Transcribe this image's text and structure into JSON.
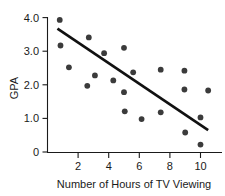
{
  "chart_data": {
    "type": "scatter",
    "title": "",
    "xlabel": "Number of Hours of TV Viewing",
    "ylabel": "GPA",
    "xlim": [
      0,
      11
    ],
    "ylim": [
      0,
      4.2
    ],
    "grid": false,
    "legend": null,
    "x_ticks": [
      "2",
      "4",
      "6",
      "8",
      "10"
    ],
    "x_tick_values": [
      2,
      4,
      6,
      8,
      10
    ],
    "y_ticks": [
      "0",
      "1.0",
      "2.0",
      "3.0",
      "4.0"
    ],
    "y_tick_values": [
      0,
      1.0,
      2.0,
      3.0,
      4.0
    ],
    "points": [
      {
        "x": 0.8,
        "y": 3.93
      },
      {
        "x": 0.85,
        "y": 3.17
      },
      {
        "x": 1.4,
        "y": 2.52
      },
      {
        "x": 2.6,
        "y": 1.97
      },
      {
        "x": 2.7,
        "y": 3.41
      },
      {
        "x": 3.1,
        "y": 2.28
      },
      {
        "x": 3.7,
        "y": 2.94
      },
      {
        "x": 4.3,
        "y": 2.13
      },
      {
        "x": 5.0,
        "y": 3.1
      },
      {
        "x": 5.0,
        "y": 1.78
      },
      {
        "x": 5.05,
        "y": 1.21
      },
      {
        "x": 5.6,
        "y": 2.37
      },
      {
        "x": 6.15,
        "y": 0.98
      },
      {
        "x": 7.4,
        "y": 2.45
      },
      {
        "x": 7.4,
        "y": 1.18
      },
      {
        "x": 8.95,
        "y": 2.42
      },
      {
        "x": 8.95,
        "y": 1.86
      },
      {
        "x": 9.0,
        "y": 0.58
      },
      {
        "x": 10.0,
        "y": 1.03
      },
      {
        "x": 10.0,
        "y": 0.22
      },
      {
        "x": 10.5,
        "y": 1.83
      }
    ],
    "trend_line": {
      "x_start": 0.65,
      "y_start": 3.67,
      "x_end": 10.5,
      "y_end": 0.65
    },
    "colors": {
      "point": "#3b3b3b",
      "line": "#111111",
      "axis": "#1a1a1a",
      "background": "#ffffff"
    }
  }
}
